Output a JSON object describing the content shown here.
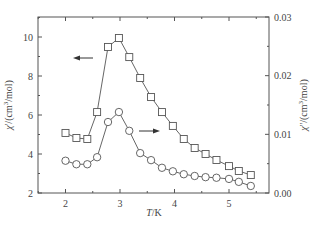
{
  "chart_data": {
    "type": "line",
    "title": "",
    "xlabel": "T/K",
    "ylabel": "χ'/(cm³/mol)",
    "ylabel_right": "χ''/(cm³/mol)",
    "xlim": [
      1.6,
      5.7
    ],
    "ylim": [
      2,
      11
    ],
    "ylim_right": [
      0.0,
      0.03
    ],
    "x_ticks": [
      2,
      3,
      4,
      5
    ],
    "y_ticks": [
      2,
      4,
      6,
      8,
      10
    ],
    "y_ticks_right": [
      "0.00",
      "0.01",
      "0.02",
      "0.03"
    ],
    "grid": false,
    "legend": null,
    "annotations": [
      {
        "type": "arrow",
        "direction": "left",
        "meaning": "squares use left axis"
      },
      {
        "type": "arrow",
        "direction": "right",
        "meaning": "circles use right axis"
      }
    ],
    "x": [
      2.0,
      2.2,
      2.4,
      2.58,
      2.78,
      2.98,
      3.17,
      3.37,
      3.57,
      3.77,
      3.97,
      4.17,
      4.37,
      4.57,
      4.77,
      5.0,
      5.18,
      5.4
    ],
    "series": [
      {
        "name": "χ' (in-phase)",
        "marker": "square",
        "axis": "left",
        "values": [
          5.08,
          4.82,
          4.77,
          6.15,
          9.49,
          9.95,
          8.97,
          7.9,
          6.92,
          6.15,
          5.44,
          4.77,
          4.31,
          4.0,
          3.69,
          3.38,
          3.13,
          2.92
        ]
      },
      {
        "name": "χ'' (out-of-phase)",
        "marker": "circle",
        "axis": "right",
        "values": [
          0.0055,
          0.0049,
          0.0049,
          0.0061,
          0.0121,
          0.0138,
          0.0106,
          0.0068,
          0.0056,
          0.0043,
          0.0037,
          0.0032,
          0.0029,
          0.0027,
          0.0026,
          0.0024,
          0.0019,
          0.0012
        ]
      }
    ]
  },
  "labels": {
    "x_axis": "T/K",
    "y_left_prefix": "χ'/(cm",
    "y_left_sup": "3",
    "y_left_suffix": "/mol)",
    "y_right_prefix": "χ''/(cm",
    "y_right_sup": "3",
    "y_right_suffix": "/mol)"
  },
  "colors": {
    "line": "#555555",
    "axis": "#555555",
    "marker_fill": "#ffffff"
  }
}
